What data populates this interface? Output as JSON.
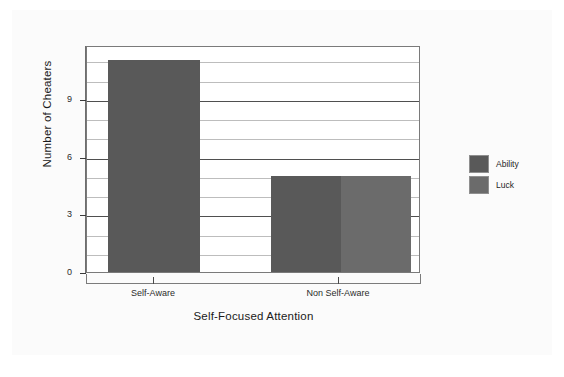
{
  "chart_data": {
    "type": "bar",
    "title": "",
    "xlabel": "Self-Focused Attention",
    "ylabel": "Number of Cheaters",
    "categories": [
      "Self-Aware",
      "Non Self-Aware"
    ],
    "series": [
      {
        "name": "Ability",
        "values": [
          11,
          5
        ],
        "color": "#595959"
      },
      {
        "name": "Luck",
        "values": [
          null,
          5
        ],
        "color": "#6b6b6b"
      }
    ],
    "ylim": [
      0,
      11.8
    ],
    "yticks": [
      0,
      3,
      6,
      9
    ],
    "ytick_labels": [
      "0",
      "3",
      "6",
      "9"
    ],
    "minor_gridlines": [
      1,
      2,
      4,
      5,
      7,
      8,
      10,
      11
    ],
    "grid": true,
    "legend_position": "right",
    "note": "Self-Aware group shows a single Ability bar of 11; Non Self-Aware group shows Ability 5 and Luck 5 side by side."
  },
  "axes": {
    "y_title": "Number of Cheaters",
    "x_title": "Self-Focused Attention",
    "y_labels": [
      "9",
      "6",
      "3",
      "0"
    ],
    "x_labels": [
      "Self-Aware",
      "Non Self-Aware"
    ]
  },
  "legend": {
    "items": [
      {
        "label": "Ability",
        "color": "#595959"
      },
      {
        "label": "Luck",
        "color": "#6b6b6b"
      }
    ]
  },
  "colors": {
    "ability": "#595959",
    "luck": "#6b6b6b",
    "frame": "#7a7a7a",
    "gridline_major": "#4f4f4f",
    "gridline_minor": "#bdbdbd",
    "background": "#ffffff",
    "panel": "#fbfbfb"
  }
}
